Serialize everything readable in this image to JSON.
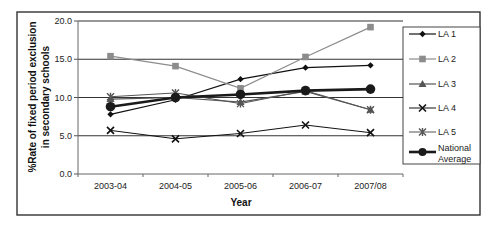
{
  "chart_data": {
    "type": "line",
    "title": "",
    "xlabel": "Year",
    "ylabel": "%Rate of fixed period exclusion in secondary schools",
    "ylabel_lines": [
      "%Rate of fixed period exclusion",
      "in secondary schools"
    ],
    "categories": [
      "2003-04",
      "2004-05",
      "2005-06",
      "2006-07",
      "2007/08"
    ],
    "ylim": [
      0,
      20
    ],
    "yticks": [
      0,
      5,
      10,
      15,
      20
    ],
    "ytick_labels": [
      "0.0",
      "5.0",
      "10.0",
      "15.0",
      "20.0"
    ],
    "grid": true,
    "legend_position": "right",
    "series": [
      {
        "name": "LA 1",
        "marker": "diamond",
        "color": "#111111",
        "width": 1.2,
        "values": [
          7.8,
          9.7,
          12.4,
          13.9,
          14.2
        ]
      },
      {
        "name": "LA 2",
        "marker": "square",
        "color": "#8c8c8c",
        "width": 1.2,
        "values": [
          15.4,
          14.1,
          11.2,
          15.3,
          19.2
        ]
      },
      {
        "name": "LA 3",
        "marker": "triangle",
        "color": "#555555",
        "width": 1.2,
        "values": [
          9.8,
          10.0,
          9.4,
          10.8,
          8.4
        ]
      },
      {
        "name": "LA 4",
        "marker": "x",
        "color": "#111111",
        "width": 1.0,
        "values": [
          5.7,
          4.6,
          5.3,
          6.4,
          5.4
        ]
      },
      {
        "name": "LA 5",
        "marker": "asterisk",
        "color": "#555555",
        "width": 1.0,
        "values": [
          10.1,
          10.6,
          9.2,
          10.9,
          8.4
        ]
      },
      {
        "name": "National Average",
        "marker": "circle",
        "color": "#1a1a1a",
        "width": 2.6,
        "values": [
          8.8,
          10.0,
          10.4,
          10.9,
          11.1
        ]
      }
    ]
  },
  "legend": {
    "items": [
      "LA 1",
      "LA 2",
      "LA 3",
      "LA 4",
      "LA 5",
      "National Average"
    ],
    "national_average_lines": [
      "National",
      "Average"
    ]
  }
}
